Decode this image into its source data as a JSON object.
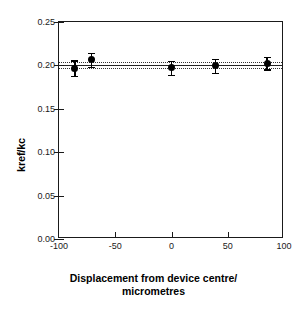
{
  "chart_data": {
    "type": "scatter",
    "title": "",
    "xlabel_line1": "Displacement from device centre/",
    "xlabel_line2": "micrometres",
    "ylabel": "kref/kc",
    "xlim": [
      -100,
      100
    ],
    "ylim": [
      0.0,
      0.25
    ],
    "xticks": [
      "-100",
      "-50",
      "0",
      "50",
      "100"
    ],
    "xtick_values": [
      -100,
      -50,
      0,
      50,
      100
    ],
    "yticks": [
      "0.00",
      "0.05",
      "0.10",
      "0.15",
      "0.20",
      "0.25"
    ],
    "ytick_values": [
      0.0,
      0.05,
      0.1,
      0.15,
      0.2,
      0.25
    ],
    "grid": false,
    "legend": "none",
    "series": [
      {
        "name": "kref/kc measurements",
        "marker": "filled-circle",
        "color": "#000000",
        "points": [
          {
            "x": -86,
            "y": 0.197,
            "yerr": 0.009
          },
          {
            "x": -71,
            "y": 0.2065,
            "yerr": 0.008
          },
          {
            "x": 0,
            "y": 0.1975,
            "yerr": 0.008
          },
          {
            "x": 39,
            "y": 0.1995,
            "yerr": 0.008
          },
          {
            "x": 85,
            "y": 0.2025,
            "yerr": 0.007
          }
        ]
      }
    ],
    "reference_lines": [
      {
        "name": "mean",
        "style": "solid",
        "y": 0.2005,
        "color": "#222222"
      },
      {
        "name": "upper-bound",
        "style": "dotted",
        "y": 0.2035,
        "color": "#333333"
      },
      {
        "name": "lower-bound",
        "style": "dotted",
        "y": 0.1975,
        "color": "#333333"
      }
    ]
  }
}
